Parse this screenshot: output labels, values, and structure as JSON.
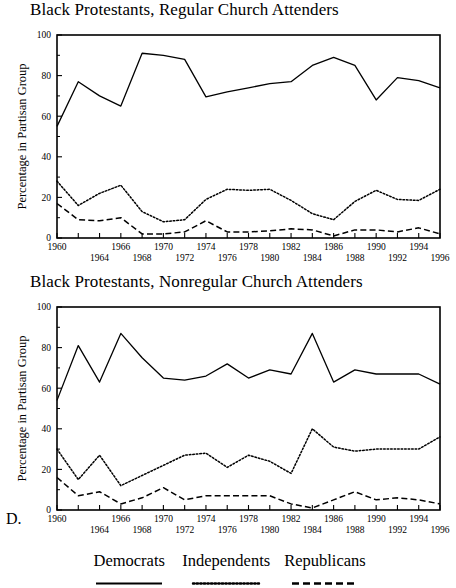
{
  "figure": {
    "label": "D.",
    "background": "#ffffff",
    "line_color": "#000000"
  },
  "legend": {
    "position": "bottom-center",
    "entries": [
      {
        "label": "Democrats",
        "style": "solid"
      },
      {
        "label": "Independents",
        "style": "dotted"
      },
      {
        "label": "Republicans",
        "style": "dashed"
      }
    ]
  },
  "chart_data": [
    {
      "type": "line",
      "title": "Black Protestants, Regular Church Attenders",
      "xlabel": "",
      "ylabel": "Percentage in Partisan Group",
      "ylim": [
        0,
        100
      ],
      "yticks": [
        0,
        20,
        40,
        60,
        80,
        100
      ],
      "xlim": [
        1960,
        1996
      ],
      "x": [
        1960,
        1962,
        1964,
        1966,
        1968,
        1970,
        1972,
        1974,
        1976,
        1978,
        1980,
        1982,
        1984,
        1986,
        1988,
        1990,
        1992,
        1994,
        1996
      ],
      "xticks": [
        1960,
        1962,
        1964,
        1966,
        1968,
        1970,
        1972,
        1974,
        1976,
        1978,
        1980,
        1982,
        1984,
        1986,
        1988,
        1990,
        1992,
        1994,
        1996
      ],
      "xtick_labels_upper": [
        1960,
        1966,
        1970,
        1974,
        1978,
        1982,
        1986,
        1990,
        1994
      ],
      "xtick_labels_lower": [
        1964,
        1968,
        1972,
        1976,
        1980,
        1984,
        1988,
        1992,
        1996
      ],
      "grid": false,
      "series": [
        {
          "name": "Democrats",
          "style": "solid",
          "values": [
            55,
            77,
            70,
            65,
            91,
            90,
            88,
            69.5,
            72,
            74,
            76,
            77,
            85,
            89,
            85,
            68,
            79,
            77.5,
            74
          ]
        },
        {
          "name": "Independents",
          "style": "dotted",
          "values": [
            28,
            16,
            22,
            26,
            13,
            8,
            9,
            19,
            24,
            23.5,
            24,
            18.5,
            12,
            9,
            18,
            23.5,
            19,
            18.5,
            24
          ]
        },
        {
          "name": "Republicans",
          "style": "dashed",
          "values": [
            17,
            9,
            8.5,
            10,
            2,
            2,
            3,
            8.5,
            3,
            3,
            3.5,
            4.5,
            4,
            1,
            4,
            4,
            3,
            5,
            2
          ]
        }
      ]
    },
    {
      "type": "line",
      "title": "Black Protestants, Nonregular Church Attenders",
      "xlabel": "",
      "ylabel": "Percentage in Partisan Group",
      "ylim": [
        0,
        100
      ],
      "yticks": [
        0,
        20,
        40,
        60,
        80,
        100
      ],
      "xlim": [
        1960,
        1996
      ],
      "x": [
        1960,
        1962,
        1964,
        1966,
        1968,
        1970,
        1972,
        1974,
        1976,
        1978,
        1980,
        1982,
        1984,
        1986,
        1988,
        1990,
        1992,
        1994,
        1996
      ],
      "xticks": [
        1960,
        1962,
        1964,
        1966,
        1968,
        1970,
        1972,
        1974,
        1976,
        1978,
        1980,
        1982,
        1984,
        1986,
        1988,
        1990,
        1992,
        1994,
        1996
      ],
      "xtick_labels_upper": [
        1960,
        1966,
        1970,
        1974,
        1978,
        1982,
        1986,
        1990,
        1994
      ],
      "xtick_labels_lower": [
        1964,
        1968,
        1972,
        1976,
        1980,
        1984,
        1988,
        1992,
        1996
      ],
      "grid": false,
      "series": [
        {
          "name": "Democrats",
          "style": "solid",
          "values": [
            54,
            81,
            63,
            87,
            75,
            65,
            64,
            66,
            72,
            65,
            69,
            67,
            87,
            63,
            69,
            67,
            67,
            67,
            62,
            68
          ]
        },
        {
          "name": "Independents",
          "style": "dotted",
          "values": [
            30,
            15,
            27,
            12,
            17,
            22,
            27,
            28,
            21,
            27,
            24,
            18,
            40,
            31,
            29,
            30,
            30,
            30,
            36,
            28
          ]
        },
        {
          "name": "Republicans",
          "style": "dashed",
          "values": [
            16,
            7,
            9,
            3,
            6,
            11,
            5,
            7,
            7,
            7,
            7,
            3,
            1,
            5,
            9,
            5,
            6,
            5,
            3,
            4
          ]
        }
      ]
    }
  ]
}
